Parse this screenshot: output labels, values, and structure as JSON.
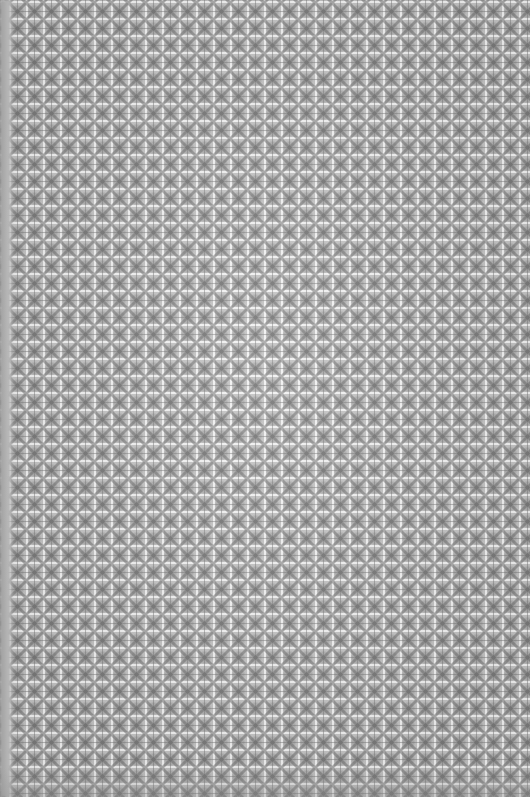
{
  "image": {
    "subject": "tiled patterned surface",
    "pattern": {
      "motif": "diamond-cross",
      "tile_pitch_px": 17,
      "tile_color": "#bdbdbd",
      "motif_color": "#7a7a7a",
      "grout_color": "#f2f2f2"
    },
    "left_edge_band_color": "#a9a9a9"
  }
}
